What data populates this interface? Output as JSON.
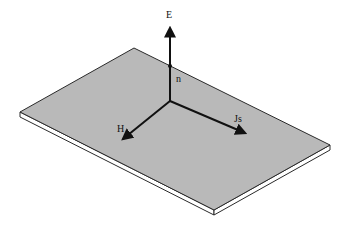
{
  "diagram": {
    "colors": {
      "plate_fill": "#b9b9b9",
      "plate_edge": "#2a2a2a",
      "vector": "#111111",
      "background": "#ffffff"
    },
    "labels": {
      "E": "E",
      "n": "n",
      "H": "H",
      "Js": "Js"
    },
    "vectors": [
      {
        "name": "E",
        "direction": "up (normal to plane)"
      },
      {
        "name": "n",
        "direction": "unit normal, along E"
      },
      {
        "name": "H",
        "direction": "down-left in plane"
      },
      {
        "name": "Js",
        "direction": "down-right in plane"
      }
    ]
  }
}
